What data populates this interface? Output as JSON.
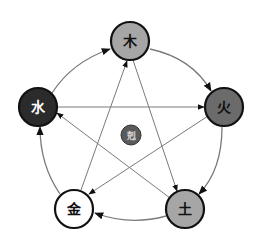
{
  "diagram": {
    "title": "",
    "center": {
      "label": "剋",
      "fill": "#5a5a5a",
      "text_color": "#d8d8d8"
    },
    "nodes": [
      {
        "id": "wood",
        "label": "木",
        "fill": "#a6a6a6",
        "text_color": "#111111"
      },
      {
        "id": "fire",
        "label": "火",
        "fill": "#6b6b6b",
        "text_color": "#111111"
      },
      {
        "id": "earth",
        "label": "土",
        "fill": "#a6a6a6",
        "text_color": "#111111"
      },
      {
        "id": "metal",
        "label": "金",
        "fill": "#ffffff",
        "text_color": "#111111"
      },
      {
        "id": "water",
        "label": "水",
        "fill": "#2b2b2b",
        "text_color": "#ffffff"
      }
    ],
    "generating_cycle": [
      {
        "from": "水",
        "to": "木"
      },
      {
        "from": "木",
        "to": "火"
      },
      {
        "from": "火",
        "to": "土"
      },
      {
        "from": "土",
        "to": "金"
      },
      {
        "from": "金",
        "to": "水"
      }
    ],
    "overcoming_cycle": [
      {
        "from": "木",
        "to": "土"
      },
      {
        "from": "土",
        "to": "水"
      },
      {
        "from": "水",
        "to": "火"
      },
      {
        "from": "火",
        "to": "金"
      },
      {
        "from": "金",
        "to": "木"
      }
    ],
    "colors": {
      "stroke": "#111111",
      "arrow_line": "#7a7a7a",
      "arrowhead": "#111111"
    }
  }
}
